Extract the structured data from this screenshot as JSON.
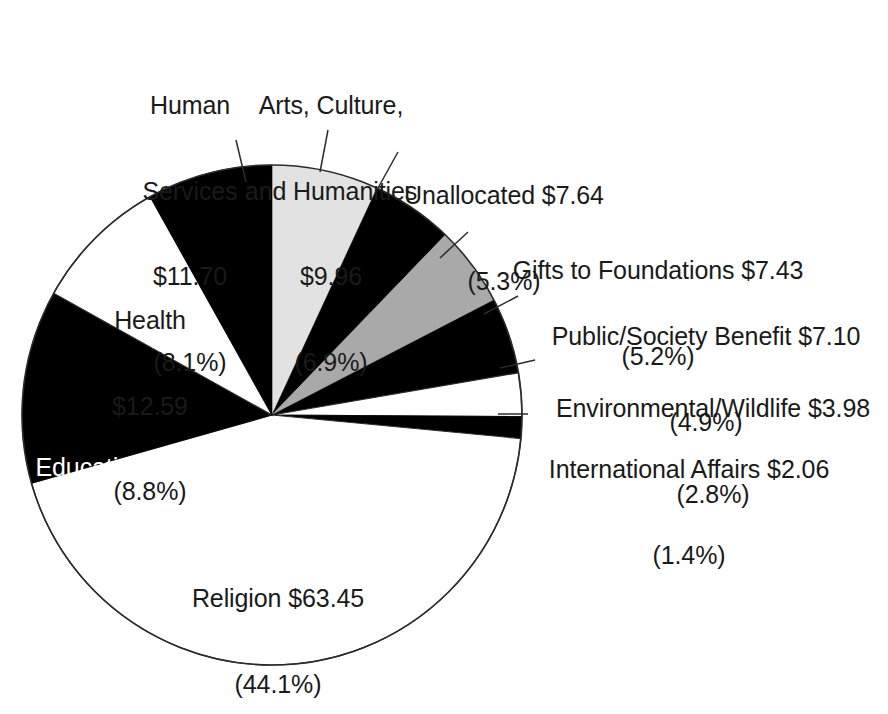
{
  "chart_data": {
    "type": "pie",
    "title": "",
    "subtitle": "",
    "units": "billions of dollars",
    "total": 143.85,
    "legend_position": "none",
    "grid": false,
    "categories": [
      "Religion",
      "Education",
      "Health",
      "Human Services",
      "Arts, Culture, and Humanities",
      "Unallocated",
      "Gifts to Foundations",
      "Public/Society Benefit",
      "Environmental/Wildlife",
      "International Affairs"
    ],
    "values": [
      63.45,
      17.94,
      12.59,
      11.7,
      9.96,
      7.64,
      7.43,
      7.1,
      3.98,
      2.06
    ],
    "percents": [
      44.1,
      12.5,
      8.8,
      8.1,
      6.9,
      5.3,
      5.2,
      4.9,
      2.8,
      1.4
    ],
    "slice_fills": [
      "#ffffff",
      "#000000",
      "#ffffff",
      "#000000",
      "#e2e2e2",
      "#000000",
      "#a9a9a9",
      "#000000",
      "#ffffff",
      "#000000"
    ],
    "slices": [
      {
        "name": "Arts, Culture, and Humanities",
        "value": 9.96,
        "percent": 6.9,
        "fill": "#e2e2e2",
        "start_deg": 0.0,
        "end_deg": 24.84
      },
      {
        "name": "Unallocated",
        "value": 7.64,
        "percent": 5.3,
        "fill": "#000000",
        "start_deg": 24.84,
        "end_deg": 43.92
      },
      {
        "name": "Gifts to Foundations",
        "value": 7.43,
        "percent": 5.2,
        "fill": "#a9a9a9",
        "start_deg": 43.92,
        "end_deg": 62.64
      },
      {
        "name": "Public/Society Benefit",
        "value": 7.1,
        "percent": 4.9,
        "fill": "#000000",
        "start_deg": 62.64,
        "end_deg": 80.28
      },
      {
        "name": "Environmental/Wildlife",
        "value": 3.98,
        "percent": 2.8,
        "fill": "#ffffff",
        "start_deg": 80.28,
        "end_deg": 90.36
      },
      {
        "name": "International Affairs",
        "value": 2.06,
        "percent": 1.4,
        "fill": "#000000",
        "start_deg": 90.36,
        "end_deg": 95.4
      },
      {
        "name": "Religion",
        "value": 63.45,
        "percent": 44.1,
        "fill": "#ffffff",
        "start_deg": 95.4,
        "end_deg": 254.16
      },
      {
        "name": "Education",
        "value": 17.94,
        "percent": 12.5,
        "fill": "#000000",
        "start_deg": 254.16,
        "end_deg": 299.16
      },
      {
        "name": "Health",
        "value": 12.59,
        "percent": 8.8,
        "fill": "#ffffff",
        "start_deg": 299.16,
        "end_deg": 330.84
      },
      {
        "name": "Human Services",
        "value": 11.7,
        "percent": 8.1,
        "fill": "#000000",
        "start_deg": 330.84,
        "end_deg": 360.0
      }
    ]
  },
  "labels": {
    "human_services": {
      "name": "Human Services",
      "line1": "Human",
      "line2": "Services",
      "line3": "$11.70",
      "line4": "(8.1%)"
    },
    "arts": {
      "name": "Arts, Culture, and Humanities",
      "line1": "Arts, Culture,",
      "line2": "and Humanities",
      "line3": "$9.96",
      "line4": "(6.9%)"
    },
    "unallocated": {
      "name": "Unallocated",
      "line1": "Unallocated $7.64",
      "line2": "(5.3%)"
    },
    "gifts": {
      "name": "Gifts to Foundations",
      "line1": "Gifts to Foundations $7.43",
      "line2": "(5.2%)"
    },
    "public_society": {
      "name": "Public/Society Benefit",
      "line1": "Public/Society Benefit $7.10",
      "line2": "(4.9%)"
    },
    "environmental": {
      "name": "Environmental/Wildlife",
      "line1": "Environmental/Wildlife $3.98",
      "line2": "(2.8%)"
    },
    "international": {
      "name": "International Affairs",
      "line1": "International Affairs $2.06",
      "line2": "(1.4%)"
    },
    "health": {
      "name": "Health",
      "line1": "Health",
      "line2": "$12.59",
      "line3": "(8.8%)"
    },
    "education": {
      "name": "Education",
      "line1": "Education $17.94",
      "line2": "(12.5%)"
    },
    "religion": {
      "name": "Religion",
      "line1": "Religion $63.45",
      "line2": "(44.1%)"
    }
  },
  "colors": {
    "background": "#ffffff",
    "text": "#1a1a1a",
    "text_on_dark": "#ffffff",
    "slice_black": "#000000",
    "slice_white": "#ffffff",
    "slice_light_gray": "#e2e2e2",
    "slice_mid_gray": "#a9a9a9",
    "outline": "#2b2b2b"
  }
}
